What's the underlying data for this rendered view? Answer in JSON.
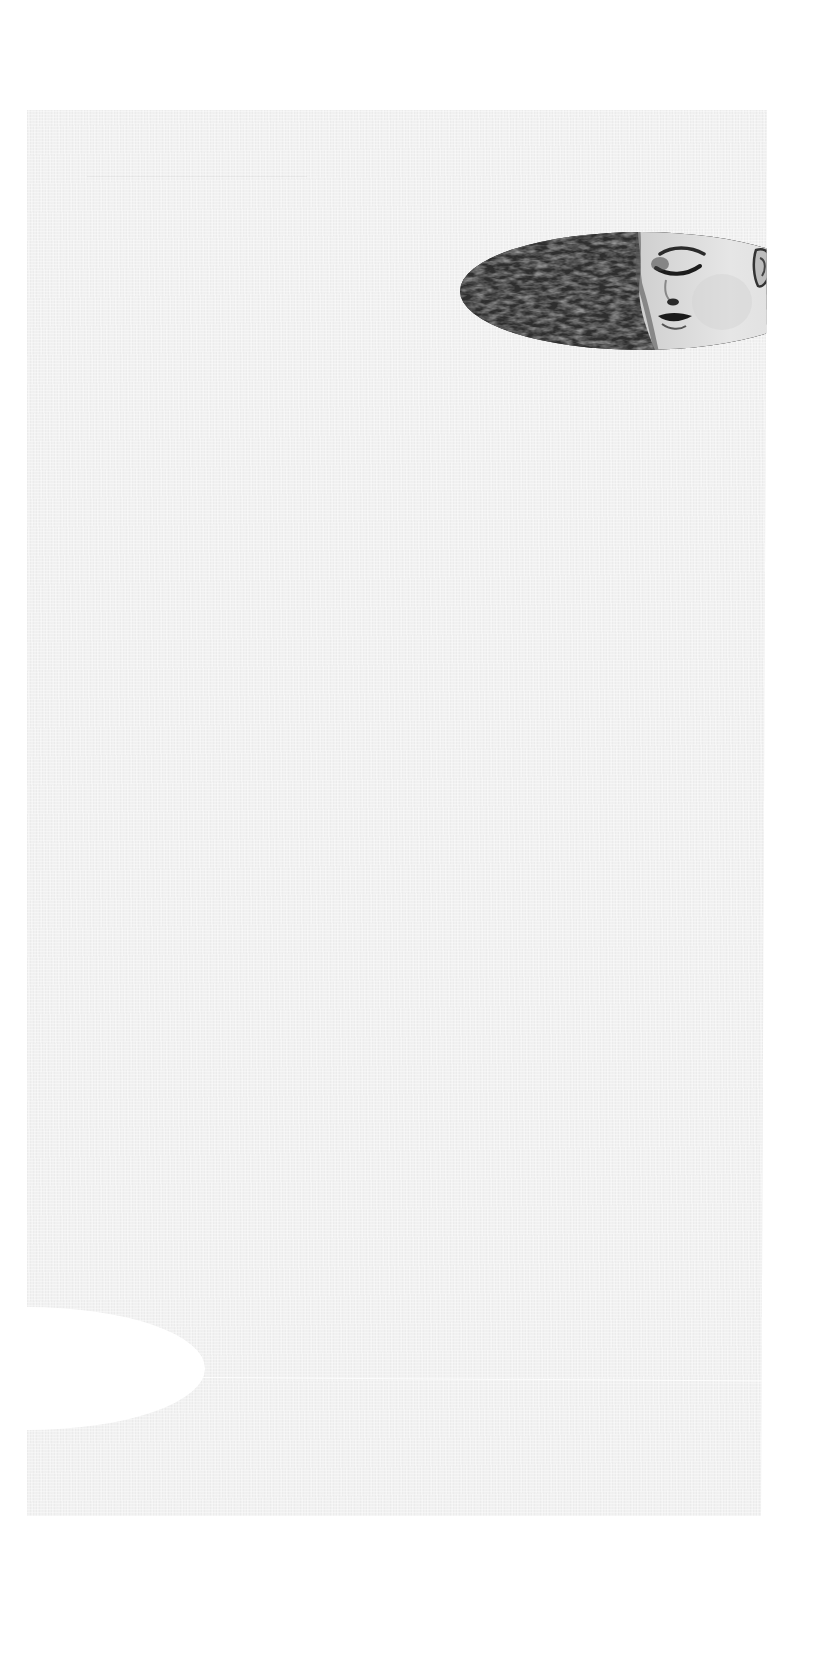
{
  "page": {
    "background_color": "#ffffff",
    "paper_color": "#f1f1f1",
    "texture": "linen paper"
  },
  "photo": {
    "shape": "ellipse",
    "style": "black-and-white",
    "subject": "close-up of a face with closed eyes beside dark foliage/hair texture",
    "clipped_by": "right paper edge"
  },
  "cutout": {
    "shape": "ellipse",
    "color": "#ffffff",
    "clipped_by": "left paper edge"
  }
}
